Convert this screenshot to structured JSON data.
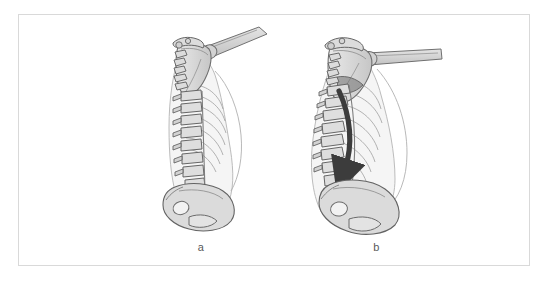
{
  "figure": {
    "background_color": "#ffffff",
    "frame": {
      "border_color": "#d9d9d9",
      "fill_color": "#ffffff"
    },
    "palette": {
      "bone_fill": "#d8d8d8",
      "bone_fill_light": "#e6e6e6",
      "bone_fill_pale": "#efefef",
      "outline": "#6e6e6e",
      "outline_dark": "#4a4a4a",
      "soft_tissue_fill": "#ededed",
      "soft_tissue_outline": "#9a9a9a",
      "arrow_color": "#3c3c3c",
      "caption_color": "#5a5a5a"
    },
    "panels": [
      {
        "id": "a",
        "caption": "a",
        "description": "Neutral upright posture: vertebral column with normal cervical, thoracic and lumbar curves; scapula and humerus elevated; pelvis in neutral tilt.",
        "has_arrow": false,
        "arrow": null
      },
      {
        "id": "b",
        "caption": "b",
        "description": "Flexed / kyphotic posture: vertebral column shows increased thoracic curvature and posterior pelvic tilt; shoulder girdle protracted with the arm held horizontally.",
        "has_arrow": true,
        "arrow": {
          "name": "spinal-flexion-arrow",
          "direction": "downward-curved",
          "color": "#3c3c3c"
        }
      }
    ]
  }
}
